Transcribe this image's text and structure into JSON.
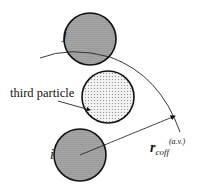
{
  "diagram": {
    "labels": {
      "particle_j": "j",
      "particle_i": "i",
      "third_particle": "third particle",
      "radius_main": "r",
      "radius_sub": "coff",
      "radius_sup": "(a.v.)"
    },
    "colors": {
      "particle_fill": "#a9a9a9",
      "third_fill": "#eeeeee",
      "stroke": "#111111"
    }
  }
}
